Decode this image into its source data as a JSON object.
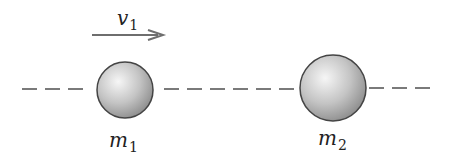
{
  "diagram": {
    "type": "collision-setup",
    "velocity": {
      "symbol": "v",
      "subscript": "1",
      "direction": "right"
    },
    "masses": [
      {
        "symbol": "m",
        "subscript": "1",
        "cx": 125,
        "cy": 90,
        "r": 28
      },
      {
        "symbol": "m",
        "subscript": "2",
        "cx": 333,
        "cy": 88,
        "r": 33
      }
    ],
    "colors": {
      "line": "#777777",
      "arrow": "#6e6e6e",
      "ball_light": "#f4f4f4",
      "ball_dark": "#8a8a8a",
      "ball_stroke": "#444444"
    }
  }
}
